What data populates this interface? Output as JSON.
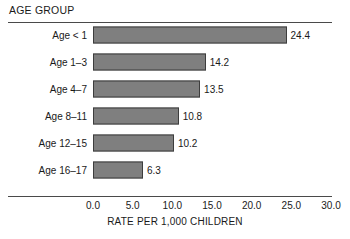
{
  "header": {
    "title": "AGE GROUP"
  },
  "chart_data": {
    "type": "bar",
    "orientation": "horizontal",
    "title": "AGE GROUP",
    "xlabel": "RATE PER 1,000 CHILDREN",
    "ylabel": "",
    "categories": [
      "Age < 1",
      "Age 1–3",
      "Age 4–7",
      "Age 8–11",
      "Age 12–15",
      "Age 16–17"
    ],
    "values": [
      24.4,
      14.2,
      13.5,
      10.8,
      10.2,
      6.3
    ],
    "value_labels": [
      "24.4",
      "14.2",
      "13.5",
      "10.8",
      "10.2",
      "6.3"
    ],
    "xlim": [
      0.0,
      30.0
    ],
    "xticks": [
      0.0,
      5.0,
      10.0,
      15.0,
      20.0,
      25.0,
      30.0
    ],
    "xtick_labels": [
      "0.0",
      "5.0",
      "10.0",
      "15.0",
      "20.0",
      "25.0",
      "30.0"
    ],
    "grid": false,
    "legend": null,
    "bar_color": "#7f7f7f",
    "bar_border_color": "#3d3d3d",
    "background_color": "#ffffff"
  }
}
